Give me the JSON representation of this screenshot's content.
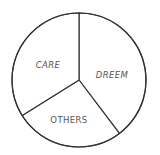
{
  "chart_data": {
    "type": "pie",
    "title": "",
    "categories": [
      "DREEM",
      "OTHERS",
      "CARE"
    ],
    "values": [
      39.7,
      26.4,
      33.9
    ],
    "units": "percent (estimated from slice angles)",
    "start_angle_deg": 0,
    "direction": "clockwise",
    "legend": "none (labels inside slices)",
    "labels": [
      {
        "text": "DREEM",
        "style": "italic"
      },
      {
        "text": "OTHERS",
        "style": "normal"
      },
      {
        "text": "CARE",
        "style": "italic"
      }
    ]
  },
  "style": {
    "stroke_color": "#333333",
    "fill_color": "#ffffff",
    "label_color": "#555555"
  }
}
